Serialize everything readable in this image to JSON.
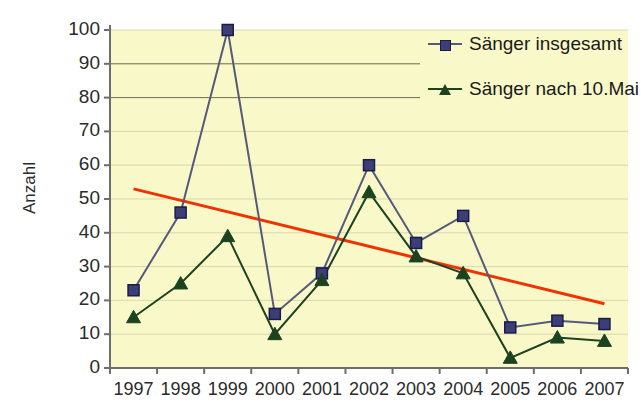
{
  "chart_data": {
    "type": "line",
    "title": "",
    "xlabel": "",
    "ylabel": "Anzahl",
    "categories": [
      "1997",
      "1998",
      "1999",
      "2000",
      "2001",
      "2002",
      "2003",
      "2004",
      "2005",
      "2006",
      "2007"
    ],
    "ylim": [
      0,
      100
    ],
    "ytick_step": 10,
    "yticks": [
      "0",
      "10",
      "20",
      "30",
      "40",
      "50",
      "60",
      "70",
      "80",
      "90",
      "100"
    ],
    "grid": "horizontal",
    "legend_position": "top-right",
    "series": [
      {
        "name": "Sänger insgesamt",
        "marker": "square",
        "color": "#3b3f76",
        "line_color": "#555a7a",
        "values": [
          23,
          46,
          100,
          16,
          28,
          60,
          37,
          45,
          12,
          14,
          13
        ]
      },
      {
        "name": "Sänger nach 10.Mai",
        "marker": "triangle",
        "color": "#1d4220",
        "line_color": "#1d4220",
        "values": [
          15,
          25,
          39,
          10,
          26,
          52,
          33,
          28,
          3,
          9,
          8
        ]
      },
      {
        "name": "Trendlinie",
        "marker": "none",
        "color": "#ee3300",
        "line_color": "#ee3300",
        "trend": true,
        "x_start": "1997",
        "x_end": "2007",
        "y_start": 53,
        "y_end": 19
      }
    ]
  },
  "plot": {
    "background_color": "#f8f8c8",
    "grid_color": "#c9c9a0",
    "axis_color": "#6d6d6d",
    "page_background": "#ffffff"
  },
  "axis": {
    "y_title": "Anzahl",
    "y_labels": [
      "100",
      "90",
      "80",
      "70",
      "60",
      "50",
      "40",
      "30",
      "20",
      "10",
      "0"
    ],
    "x_labels": [
      "1997",
      "1998",
      "1999",
      "2000",
      "2001",
      "2002",
      "2003",
      "2004",
      "2005",
      "2006",
      "2007"
    ]
  },
  "legend": {
    "items": [
      {
        "label": "Sänger insgesamt",
        "marker": "square-marker",
        "color": "#3b3f76",
        "line": "#555a7a"
      },
      {
        "label": "Sänger nach 10.Mai",
        "marker": "triangle-marker",
        "color": "#1d4220",
        "line": "#1d4220"
      }
    ]
  }
}
